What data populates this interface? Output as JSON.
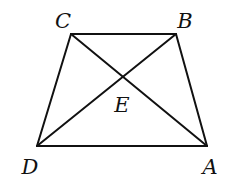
{
  "diagram": {
    "type": "geometry",
    "shape": "trapezoid with diagonals",
    "stroke_color": "#111111",
    "points": {
      "A": {
        "label": "A",
        "x": 207,
        "y": 146,
        "label_x": 210,
        "label_y": 174
      },
      "B": {
        "label": "B",
        "x": 176,
        "y": 34,
        "label_x": 185,
        "label_y": 28
      },
      "C": {
        "label": "C",
        "x": 71,
        "y": 34,
        "label_x": 63,
        "label_y": 28
      },
      "D": {
        "label": "D",
        "x": 37,
        "y": 146,
        "label_x": 30,
        "label_y": 174
      },
      "E": {
        "label": "E",
        "x": 123,
        "y": 79,
        "label_x": 122,
        "label_y": 112
      }
    },
    "segments": [
      "CB",
      "BA",
      "AD",
      "DC",
      "CA",
      "DB"
    ]
  }
}
